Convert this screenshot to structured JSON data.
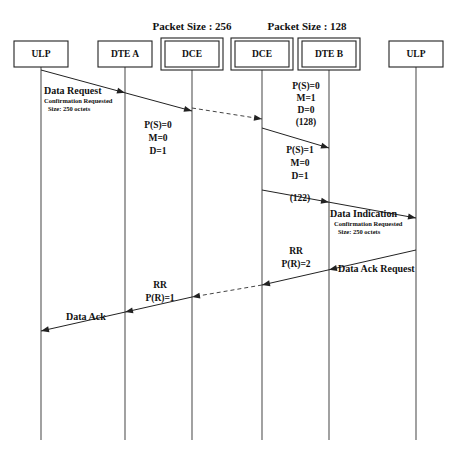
{
  "diagram": {
    "type": "sequence-diagram",
    "width": 455,
    "height": 459,
    "background_color": "#ffffff",
    "line_color": "#222222",
    "text_color": "#111111"
  },
  "group_labels": [
    {
      "text": "Packet Size : 256",
      "x": 192,
      "y": 30
    },
    {
      "text": "Packet Size : 128",
      "x": 307,
      "y": 30
    }
  ],
  "lanes": [
    {
      "id": "ulp-left",
      "label": "ULP",
      "x": 41,
      "double_border": false
    },
    {
      "id": "dte-a",
      "label": "DTE A",
      "x": 125,
      "double_border": false
    },
    {
      "id": "dce-left",
      "label": "DCE",
      "x": 192,
      "double_border": true
    },
    {
      "id": "dce-right",
      "label": "DCE",
      "x": 262,
      "double_border": true
    },
    {
      "id": "dte-b",
      "label": "DTE B",
      "x": 329,
      "double_border": true
    },
    {
      "id": "ulp-right",
      "label": "ULP",
      "x": 416,
      "double_border": false
    }
  ],
  "lane_box": {
    "top": 41,
    "height": 26,
    "width": 54,
    "lifeline_bottom": 440
  },
  "messages": [
    {
      "id": "data-request",
      "style": "solid",
      "from_x": 41,
      "from_y": 70,
      "to_x": 192,
      "to_y": 111,
      "mid_head_x": 125,
      "labels": [
        {
          "text": "Data Request",
          "class": "msg-title",
          "x": 44,
          "y": 94
        },
        {
          "text": "Confirmation Requested",
          "class": "msg-sub",
          "x": 44,
          "y": 103
        },
        {
          "text": "Size: 250 octets",
          "class": "msg-sub",
          "x": 48,
          "y": 111
        }
      ]
    },
    {
      "id": "dce-to-dce-1",
      "style": "dashed",
      "from_x": 192,
      "from_y": 108,
      "to_x": 262,
      "to_y": 119,
      "labels": []
    },
    {
      "id": "dce-right-to-dte-b-1",
      "style": "solid",
      "from_x": 262,
      "from_y": 128,
      "to_x": 329,
      "to_y": 148,
      "labels": []
    },
    {
      "id": "dce-right-to-ulp-right",
      "style": "solid",
      "from_x": 262,
      "from_y": 190,
      "to_x": 416,
      "to_y": 218,
      "mid_head_x": 329,
      "labels": [
        {
          "text": "Data Indication",
          "class": "msg-title",
          "x": 330,
          "y": 217
        },
        {
          "text": "Confirmation Requested",
          "class": "msg-sub",
          "x": 334,
          "y": 226
        },
        {
          "text": "Size: 250 octets",
          "class": "msg-sub",
          "x": 338,
          "y": 234
        }
      ]
    },
    {
      "id": "data-ack-request",
      "style": "solid",
      "from_x": 416,
      "from_y": 250,
      "to_x": 262,
      "to_y": 285,
      "mid_head_x": 329,
      "labels": [
        {
          "text": "Data Ack Request",
          "class": "msg-title",
          "x": 338,
          "y": 272
        }
      ]
    },
    {
      "id": "dce-to-dce-2",
      "style": "dashed",
      "from_x": 262,
      "from_y": 285,
      "to_x": 192,
      "to_y": 297,
      "labels": []
    },
    {
      "id": "data-ack",
      "style": "solid",
      "from_x": 192,
      "from_y": 297,
      "to_x": 41,
      "to_y": 331,
      "mid_head_x": 125,
      "labels": [
        {
          "text": "Data Ack",
          "class": "msg-title",
          "x": 66,
          "y": 320
        }
      ]
    }
  ],
  "parameter_blocks": [
    {
      "id": "ps0-left",
      "x": 158,
      "lines": [
        {
          "text": "P(S)=0",
          "y": 128
        },
        {
          "text": "M=0",
          "y": 141
        },
        {
          "text": "D=1",
          "y": 154
        }
      ]
    },
    {
      "id": "ps0-right",
      "x": 306,
      "lines": [
        {
          "text": "P(S)=0",
          "y": 89
        },
        {
          "text": "M=1",
          "y": 101
        },
        {
          "text": "D=0",
          "y": 113
        },
        {
          "text": "(128)",
          "y": 125
        }
      ]
    },
    {
      "id": "ps1-right",
      "x": 300,
      "lines": [
        {
          "text": "P(S)=1",
          "y": 153
        },
        {
          "text": "M=0",
          "y": 166
        },
        {
          "text": "D=1",
          "y": 179
        },
        {
          "text": "(122)",
          "y": 201
        }
      ]
    },
    {
      "id": "rr-pr2",
      "x": 296,
      "lines": [
        {
          "text": "RR",
          "y": 254
        },
        {
          "text": "P(R)=2",
          "y": 267
        }
      ]
    },
    {
      "id": "rr-pr1",
      "x": 160,
      "lines": [
        {
          "text": "RR",
          "y": 288
        },
        {
          "text": "P(R)=1",
          "y": 301
        }
      ]
    }
  ]
}
